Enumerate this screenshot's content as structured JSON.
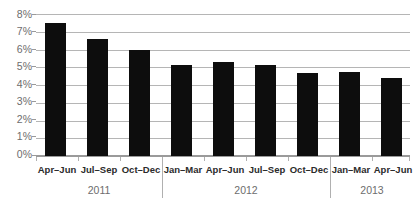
{
  "chart_data": {
    "type": "bar",
    "title": "",
    "subtitle": "",
    "xlabel": "",
    "ylabel": "",
    "ylim": [
      0,
      8
    ],
    "grid": true,
    "legend": "none",
    "categories": [
      "Apr–Jun",
      "Jul–Sep",
      "Oct–Dec",
      "Jan–Mar",
      "Apr–Jun",
      "Jul–Sep",
      "Oct–Dec",
      "Jan–Mar",
      "Apr–Jun"
    ],
    "values": [
      7.5,
      6.6,
      6.0,
      5.1,
      5.3,
      5.1,
      4.65,
      4.75,
      4.4
    ],
    "value_labels": [
      "",
      "",
      "",
      "",
      "",
      "",
      "",
      "",
      ""
    ],
    "ytick_labels": [
      "8%",
      "7%",
      "6%",
      "5%",
      "4%",
      "3%",
      "2%",
      "1%",
      "0%"
    ],
    "ytick_values": [
      8,
      7,
      6,
      5,
      4,
      3,
      2,
      1,
      0
    ],
    "groups": [
      {
        "label": "2011",
        "start": 0,
        "count": 3
      },
      {
        "label": "2012",
        "start": 3,
        "count": 4
      },
      {
        "label": "2013",
        "start": 7,
        "count": 2
      }
    ],
    "bar_color": "#0d0d0d",
    "grid_color": "#b5b5b5",
    "axis_color": "#9a9a9a",
    "label_color": "#2b2b2b",
    "tick_label_color": "#6d6d6d"
  }
}
